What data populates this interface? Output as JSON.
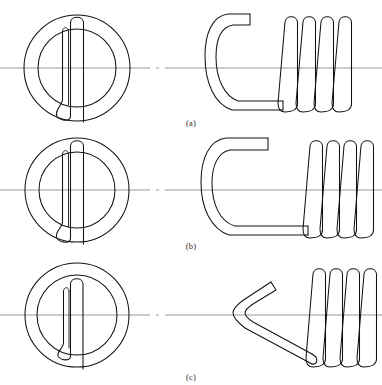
{
  "figure": {
    "background_color": "#ffffff",
    "line_color": "#15130f",
    "centerline_color": "#8d8d8d",
    "panel_count": 3
  },
  "panels": [
    {
      "id": "a",
      "caption": "(a)",
      "end_view": {
        "name": "end-view-loop",
        "description": "circular end view with full round loop",
        "outer_circle_radius": 52,
        "inner_circle_radius": 38,
        "loop_type": "full-round-machine-loop"
      },
      "side_view": {
        "name": "side-view-hook",
        "description": "C shaped short hook over center with coil body",
        "hook_style": "machine-loop-over-center",
        "coil_turns": 4
      }
    },
    {
      "id": "b",
      "caption": "(b)",
      "end_view": {
        "name": "end-view-loop",
        "description": "circular end view with full round loop",
        "outer_circle_radius": 52,
        "inner_circle_radius": 38,
        "loop_type": "full-round-machine-loop"
      },
      "side_view": {
        "name": "side-view-hook",
        "description": "extended C shaped long hook over center with coil body",
        "hook_style": "extended-hook-over-center",
        "coil_turns": 4
      }
    },
    {
      "id": "c",
      "caption": "(c)",
      "end_view": {
        "name": "end-view-loop",
        "description": "circular end view with small narrow loop",
        "outer_circle_radius": 52,
        "inner_circle_radius": 40,
        "loop_type": "small-offset-hook"
      },
      "side_view": {
        "name": "side-view-hook",
        "description": "V shaped angled hook at side with coil body",
        "hook_style": "v-bend-side-hook",
        "coil_turns": 4
      }
    }
  ],
  "captions": {
    "a": "(a)",
    "b": "(b)",
    "c": "(c)"
  }
}
